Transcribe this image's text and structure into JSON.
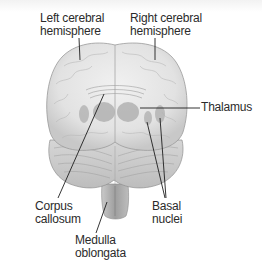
{
  "diagram": {
    "labels": {
      "left_hemisphere": [
        "Left cerebral",
        "hemisphere"
      ],
      "right_hemisphere": [
        "Right cerebral",
        "hemisphere"
      ],
      "thalamus": [
        "Thalamus"
      ],
      "corpus_callosum": [
        "Corpus",
        "callosum"
      ],
      "basal_nuclei": [
        "Basal",
        "nuclei"
      ],
      "medulla": [
        "Medulla",
        "oblongata"
      ]
    },
    "colors": {
      "brain_fill": "#e6e6e6",
      "brain_shadow": "#b9b9b9",
      "deep_structures": "#a9a9a9",
      "leader_line": "#1e1e1e",
      "label_text": "#2b2b2b"
    }
  }
}
